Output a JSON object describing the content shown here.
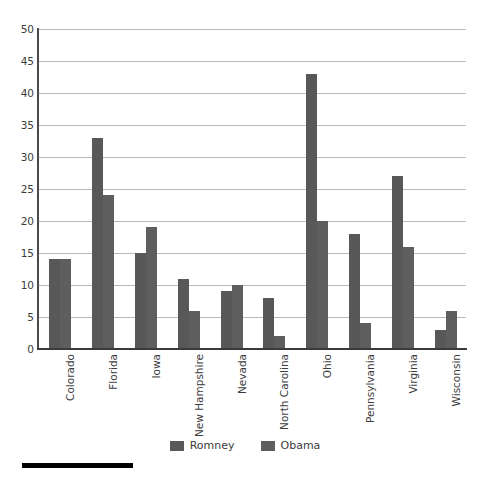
{
  "chart_data": {
    "type": "bar",
    "title": "",
    "subtitle": "",
    "xlabel": "",
    "ylabel": "",
    "ylim": [
      0,
      50
    ],
    "ytick_step": 5,
    "yticks": [
      50,
      45,
      40,
      35,
      30,
      25,
      20,
      15,
      10,
      5,
      0
    ],
    "grid": true,
    "legend_position": "bottom",
    "categories": [
      "Colorado",
      "Florida",
      "Iowa",
      "New Hampshire",
      "Nevada",
      "North Carolina",
      "Ohio",
      "Pennsylvania",
      "Virginia",
      "Wisconsin"
    ],
    "series": [
      {
        "name": "Romney",
        "color": "#585858",
        "values": [
          14,
          33,
          15,
          11,
          9,
          8,
          43,
          18,
          27,
          3
        ]
      },
      {
        "name": "Obama",
        "color": "#5e5e5e",
        "values": [
          14,
          24,
          19,
          6,
          10,
          2,
          20,
          4,
          16,
          6
        ]
      }
    ]
  },
  "legend": {
    "items": [
      {
        "label": "Romney",
        "color": "#585858"
      },
      {
        "label": "Obama",
        "color": "#5e5e5e"
      }
    ]
  },
  "decorations": {
    "bottom_rule_color": "#000000",
    "gridline_color": "#b9b9b9",
    "axis_color": "#4a4a4a",
    "background": "#ffffff"
  }
}
